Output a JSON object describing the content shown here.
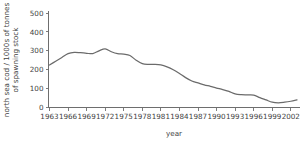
{
  "chart_data": {
    "type": "line",
    "title": "",
    "xlabel": "year",
    "ylabel": "north sea cod / 1000s of tonnes of spawning stock",
    "ylabel_line1": "north sea cod / 1000s of tonnes",
    "ylabel_line2": "of spawning stock",
    "xlim": [
      1963,
      2003
    ],
    "ylim": [
      0,
      500
    ],
    "grid": false,
    "legend": false,
    "line_color": "#6b6b6b",
    "axis_color": "#6e6e6e",
    "background_color": "#ffffff",
    "yticks": [
      0,
      100,
      200,
      300,
      400,
      500
    ],
    "ytick_labels": [
      "0",
      "100",
      "200",
      "300",
      "400",
      "500"
    ],
    "xticks": [
      1963,
      1966,
      1969,
      1972,
      1975,
      1978,
      1981,
      1984,
      1987,
      1990,
      1993,
      1996,
      1999,
      2002
    ],
    "xtick_labels": [
      "1963",
      "1966",
      "1969",
      "1972",
      "1975",
      "1978",
      "1981",
      "1984",
      "1987",
      "1990",
      "1993",
      "1996",
      "1999",
      "2002"
    ],
    "x": [
      1963,
      1964,
      1965,
      1966,
      1967,
      1968,
      1969,
      1970,
      1971,
      1972,
      1973,
      1974,
      1975,
      1976,
      1977,
      1978,
      1979,
      1980,
      1981,
      1982,
      1983,
      1984,
      1985,
      1986,
      1987,
      1988,
      1989,
      1990,
      1991,
      1992,
      1993,
      1994,
      1995,
      1996,
      1997,
      1998,
      1999,
      2000,
      2001,
      2002,
      2003
    ],
    "values": [
      225,
      245,
      265,
      285,
      292,
      290,
      287,
      285,
      300,
      310,
      295,
      285,
      282,
      275,
      250,
      232,
      228,
      228,
      225,
      215,
      200,
      180,
      158,
      140,
      130,
      120,
      112,
      103,
      95,
      85,
      72,
      68,
      67,
      66,
      52,
      40,
      28,
      25,
      28,
      33,
      40
    ],
    "series": [
      {
        "name": "north sea cod spawning stock",
        "values": [
          225,
          245,
          265,
          285,
          292,
          290,
          287,
          285,
          300,
          310,
          295,
          285,
          282,
          275,
          250,
          232,
          228,
          228,
          225,
          215,
          200,
          180,
          158,
          140,
          130,
          120,
          112,
          103,
          95,
          85,
          72,
          68,
          67,
          66,
          52,
          40,
          28,
          25,
          28,
          33,
          40
        ]
      }
    ]
  }
}
